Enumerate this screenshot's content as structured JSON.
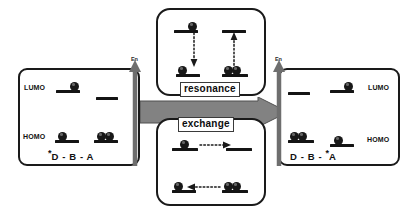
{
  "figure": {
    "background_color": "#ffffff",
    "line_color": "#141414",
    "arrow_fill": "#808080",
    "arrow_stroke": "#4d4d4d"
  },
  "big_arrow": {
    "name": "process-arrow",
    "direction": "right",
    "fill": "#808080"
  },
  "left_state": {
    "formula_prefix": "*",
    "formula": "D - B - A",
    "formula_full": "*D - B - A",
    "axis_label": "En",
    "lumo_label": "LUMO",
    "homo_label": "HOMO",
    "description": "Donor excited state",
    "levels": [
      {
        "site": "donor",
        "orbital": "LUMO",
        "electrons": 1
      },
      {
        "site": "acceptor",
        "orbital": "LUMO",
        "electrons": 0
      },
      {
        "site": "donor",
        "orbital": "HOMO",
        "electrons": 1
      },
      {
        "site": "acceptor",
        "orbital": "HOMO",
        "electrons": 2
      }
    ]
  },
  "right_state": {
    "formula_prefix": "*",
    "formula": "D - B - A",
    "formula_full": "D - B - *A",
    "axis_label": "En",
    "lumo_label": "LUMO",
    "homo_label": "HOMO",
    "description": "Acceptor excited state",
    "levels": [
      {
        "site": "donor",
        "orbital": "LUMO",
        "electrons": 0
      },
      {
        "site": "acceptor",
        "orbital": "LUMO",
        "electrons": 1
      },
      {
        "site": "donor",
        "orbital": "HOMO",
        "electrons": 2
      },
      {
        "site": "acceptor",
        "orbital": "HOMO",
        "electrons": 1
      }
    ]
  },
  "resonance": {
    "tag": "resonance",
    "description": "Vertical resonance transfer between LUMO and HOMO levels",
    "pairs": [
      {
        "side": "left",
        "arrow_direction": "down",
        "upper_electrons": 1,
        "lower_electrons": 1
      },
      {
        "side": "right",
        "arrow_direction": "up",
        "upper_electrons": 0,
        "lower_electrons": 2
      }
    ]
  },
  "exchange": {
    "tag": "exchange",
    "description": "Horizontal exchange transfer between donor and acceptor sites",
    "rows": [
      {
        "orbital": "LUMO",
        "arrow_direction": "right",
        "left_electrons": 1,
        "right_electrons": 0
      },
      {
        "orbital": "HOMO",
        "arrow_direction": "left",
        "left_electrons": 1,
        "right_electrons": 2
      }
    ]
  }
}
